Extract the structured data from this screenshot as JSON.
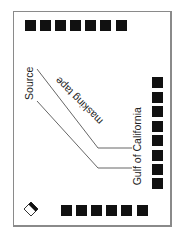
{
  "labels": {
    "source": "Source",
    "masking_tape": "masking tape",
    "gulf": "Gulf of California"
  },
  "squares": {
    "top_row_count": 7,
    "right_column_count": 8,
    "bottom_row_count": 6
  },
  "icon": "slide-label-icon",
  "colors": {
    "square": "#111111",
    "line": "#555555",
    "border": "#8a8a8a"
  }
}
